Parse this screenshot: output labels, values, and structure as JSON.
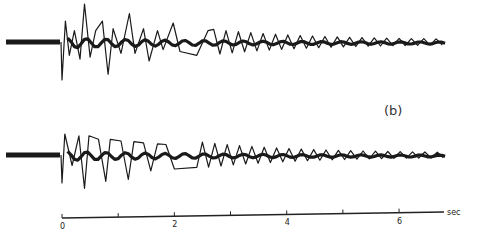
{
  "chart_data": {
    "type": "line",
    "title": "",
    "panel_label": "(b)",
    "xlabel": "sec",
    "ylabel": "",
    "xlim": [
      0,
      6.8
    ],
    "x_ticks": [
      0,
      1,
      2,
      3,
      4,
      5,
      6
    ],
    "x_tick_labels": [
      "0",
      "",
      "2",
      "",
      "4",
      "",
      "6"
    ],
    "grid": false,
    "series": [
      {
        "name": "trace-upper",
        "pre_event_baseline_sec": 1.2,
        "onset_sec": 0.0,
        "decay_note": "large-amplitude oscillation decaying over ~7 s",
        "peaks": [
          {
            "t": 0.0,
            "a": -1.0
          },
          {
            "t": 0.06,
            "a": 0.55
          },
          {
            "t": 0.13,
            "a": -0.35
          },
          {
            "t": 0.22,
            "a": 0.3
          },
          {
            "t": 0.32,
            "a": -0.45
          },
          {
            "t": 0.4,
            "a": 1.0
          },
          {
            "t": 0.5,
            "a": -0.4
          },
          {
            "t": 0.6,
            "a": 0.3
          },
          {
            "t": 0.72,
            "a": 0.55
          },
          {
            "t": 0.82,
            "a": -0.85
          },
          {
            "t": 0.91,
            "a": 0.35
          },
          {
            "t": 1.05,
            "a": -0.3
          },
          {
            "t": 1.2,
            "a": 0.75
          },
          {
            "t": 1.3,
            "a": -0.3
          },
          {
            "t": 1.45,
            "a": 0.35
          },
          {
            "t": 1.55,
            "a": -0.5
          },
          {
            "t": 1.7,
            "a": 0.3
          },
          {
            "t": 1.8,
            "a": -0.2
          },
          {
            "t": 1.98,
            "a": 0.5
          },
          {
            "t": 2.1,
            "a": -0.25
          },
          {
            "t": 2.4,
            "a": -0.35
          },
          {
            "t": 2.6,
            "a": 0.3
          }
        ]
      },
      {
        "name": "trace-lower",
        "pre_event_baseline_sec": 1.2,
        "onset_sec": 0.0,
        "decay_note": "regular oscillation decaying over ~7 s",
        "peaks": [
          {
            "t": 0.0,
            "a": -0.8
          },
          {
            "t": 0.05,
            "a": 0.6
          },
          {
            "t": 0.18,
            "a": -0.3
          },
          {
            "t": 0.3,
            "a": 0.55
          },
          {
            "t": 0.4,
            "a": -0.95
          },
          {
            "t": 0.48,
            "a": 0.55
          },
          {
            "t": 0.65,
            "a": 0.45
          },
          {
            "t": 0.78,
            "a": -0.75
          },
          {
            "t": 0.86,
            "a": 0.45
          },
          {
            "t": 1.05,
            "a": 0.4
          },
          {
            "t": 1.18,
            "a": -0.7
          },
          {
            "t": 1.28,
            "a": 0.38
          },
          {
            "t": 1.45,
            "a": 0.35
          },
          {
            "t": 1.58,
            "a": -0.45
          },
          {
            "t": 1.7,
            "a": 0.32
          },
          {
            "t": 1.85,
            "a": 0.3
          },
          {
            "t": 2.0,
            "a": -0.4
          },
          {
            "t": 2.4,
            "a": -0.35
          }
        ]
      }
    ]
  }
}
